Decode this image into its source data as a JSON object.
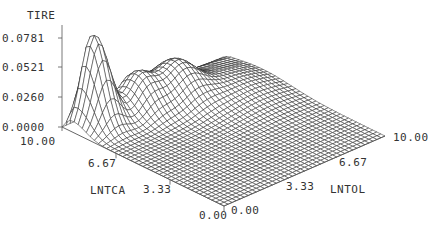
{
  "chart_data": {
    "type": "surface3d",
    "zlabel": "TIRE",
    "xlabel": "LNTCA",
    "ylabel": "LNTOL",
    "z_ticks": [
      "0.0781",
      "0.0521",
      "0.0260",
      "0.0000"
    ],
    "x_ticks": [
      "10.00",
      "6.67",
      "3.33",
      "0.00"
    ],
    "y_ticks": [
      "0.00",
      "3.33",
      "6.67",
      "10.00"
    ],
    "xlim": [
      0,
      10
    ],
    "ylim": [
      0,
      10
    ],
    "zlim": [
      0,
      0.0781
    ],
    "grid": "wireframe 40x40",
    "peaks": [
      {
        "LNTCA": 9.3,
        "LNTOL": 1.3,
        "TIRE": 0.0781
      },
      {
        "LNTCA": 8.6,
        "LNTOL": 3.6,
        "TIRE": 0.048
      },
      {
        "LNTCA": 8.0,
        "LNTOL": 5.4,
        "TIRE": 0.04
      }
    ],
    "line_color": "#222222"
  }
}
